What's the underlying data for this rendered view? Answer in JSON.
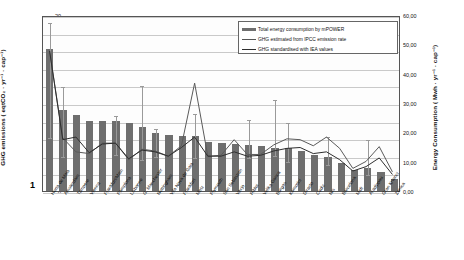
{
  "axes": {
    "left_title": "GHG emissions ( eqtCO₂ · yr⁻¹ · cap⁻¹)",
    "right_title": "Energy Consumption ( Mwh · yr⁻¹ · cap⁻¹)",
    "left_ticks": [
      "0",
      "2",
      "4",
      "6",
      "8",
      "10",
      "12",
      "14",
      "16",
      "18",
      "20"
    ],
    "right_ticks": [
      "0,00",
      "10,00",
      "20,00",
      "30,00",
      "40,00",
      "50,00",
      "60,00"
    ],
    "baseline_label": "1"
  },
  "legend": {
    "items": [
      {
        "label": "Total energy consumption by mPOWER",
        "marker": "bar",
        "color": "#6e6e6e"
      },
      {
        "label": "GHG estimated from IPCC emission rate",
        "marker": "line",
        "color": "#555555"
      },
      {
        "label": "GHG standardised with IEA values",
        "marker": "line",
        "color": "#2f2f2f"
      }
    ]
  },
  "chart_data": {
    "type": "bar",
    "title": "",
    "xlabel": "",
    "ylabel": "GHG emissions ( eqtCO2 . yr-1 . cap-1)",
    "ylabel_secondary": "Energy Consumption ( Mwh . yr-1 . cap-1)",
    "ylim": [
      0,
      20
    ],
    "ylim_secondary": [
      0,
      60
    ],
    "grid": true,
    "legend_position": "top-right",
    "categories": [
      "Horta de Maia",
      "Amsterdam",
      "Tampere",
      "Vienna",
      "Frankfurt/Main",
      "Pamplona",
      "Lisbonne",
      "G. Manchester",
      "Nottingham",
      "Vila Nova de Gaia",
      "Frankfurt",
      "Metz",
      "Plymouth",
      "San Sebastian",
      "Vaxjo",
      "Ribloi",
      "Velika Gorica",
      "Burgas",
      "Komotini",
      "Diraclo",
      "Cadiz",
      "Nis",
      "Barcelona",
      "Midt",
      "Aradippou",
      "Gran Krtonci",
      "Zenica"
    ],
    "series": [
      {
        "name": "Total energy consumption by mPOWER",
        "axis": "right",
        "type": "bar",
        "values": [
          16.1,
          9.2,
          8.6,
          7.9,
          7.9,
          7.9,
          7.7,
          7.3,
          6.6,
          6.4,
          6.3,
          6.2,
          5.6,
          5.5,
          5.3,
          5.2,
          5.1,
          4.9,
          4.9,
          4.6,
          4.1,
          3.9,
          3.2,
          2.4,
          2.6,
          2.2,
          1.4
        ]
      },
      {
        "name": "GHG estimated from IPCC emission rate",
        "axis": "left",
        "type": "line",
        "values": [
          16.1,
          6.1,
          4.5,
          4.3,
          5.5,
          5.5,
          3.6,
          4.8,
          4.6,
          4.0,
          5.2,
          12.4,
          4.0,
          4.1,
          5.9,
          4.2,
          4.2,
          5.3,
          6.0,
          5.9,
          5.2,
          6.2,
          4.9,
          2.6,
          3.4,
          5.1,
          2.2
        ]
      },
      {
        "name": "GHG standardised with IEA values",
        "axis": "left",
        "type": "line",
        "values": [
          16.1,
          5.9,
          6.2,
          4.4,
          5.4,
          5.5,
          3.7,
          4.7,
          4.5,
          4.0,
          5.0,
          6.2,
          4.0,
          4.0,
          4.5,
          4.0,
          4.1,
          4.6,
          4.9,
          5.0,
          4.3,
          4.5,
          3.6,
          2.3,
          2.8,
          3.8,
          1.9
        ]
      }
    ],
    "error_bars": {
      "series": "Total energy consumption by mPOWER",
      "upper": [
        19.3,
        12.0,
        null,
        null,
        null,
        8.7,
        null,
        12.2,
        7.3,
        null,
        null,
        9.0,
        null,
        null,
        null,
        8.3,
        null,
        10.6,
        8.0,
        null,
        null,
        6.4,
        null,
        null,
        6.0,
        null,
        null
      ],
      "lower": [
        6.3,
        4.1,
        null,
        null,
        null,
        4.3,
        null,
        3.7,
        4.1,
        null,
        null,
        4.0,
        null,
        null,
        null,
        4.0,
        null,
        4.2,
        3.5,
        null,
        null,
        3.2,
        null,
        null,
        2.0,
        null,
        null
      ]
    }
  }
}
